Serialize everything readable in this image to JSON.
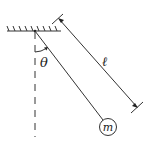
{
  "diagram": {
    "type": "simple pendulum",
    "labels": {
      "angle": "θ",
      "length": "ℓ",
      "mass": "m"
    },
    "colors": {
      "stroke": "#333333",
      "background": "#ffffff"
    }
  }
}
